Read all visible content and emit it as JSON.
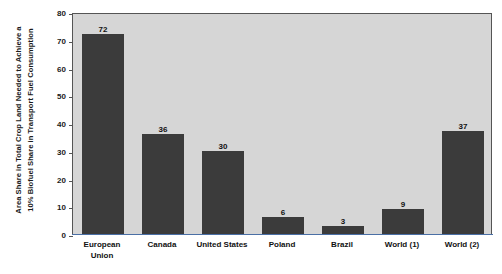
{
  "chart_data": {
    "type": "bar",
    "title": "",
    "subtitle": "",
    "xlabel": "",
    "ylabel_line1": "Area Share in Total Crop Land Needed to Achieve a",
    "ylabel_line2": "10% Biofuel Share in Transport Fuel Consumption",
    "categories": [
      "European\nUnion",
      "Canada",
      "United States",
      "Poland",
      "Brazil",
      "World (1)",
      "World (2)"
    ],
    "values": [
      72,
      36,
      30,
      6,
      3,
      9,
      37
    ],
    "value_labels": [
      "72",
      "36",
      "30",
      "6",
      "3",
      "9",
      "37"
    ],
    "ylim": [
      0,
      80
    ],
    "yticks": [
      0,
      10,
      20,
      30,
      40,
      50,
      60,
      70,
      80
    ],
    "ytick_labels": [
      "0",
      "10",
      "20",
      "30",
      "40",
      "50",
      "60",
      "70",
      "80"
    ],
    "grid": false,
    "legend": "none",
    "colors": {
      "bar": "#3b3b3b",
      "plot_background": "#d6d6d6",
      "plot_border": "#555555",
      "axis_line": "#4a6fa5",
      "text": "#111111",
      "page_background": "#ffffff"
    }
  }
}
